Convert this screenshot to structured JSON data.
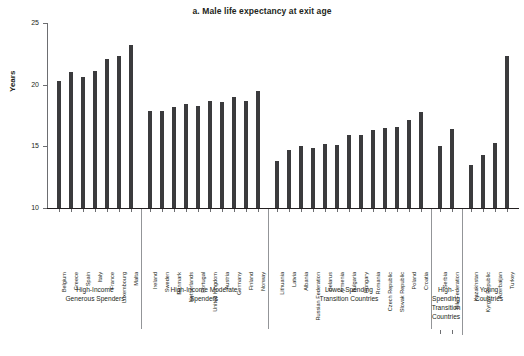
{
  "chart_data": {
    "type": "bar",
    "title": "a. Male life expectancy at exit age",
    "xlabel": "",
    "ylabel": "Years",
    "ylim": [
      10,
      25
    ],
    "yticks": [
      10,
      15,
      20,
      25
    ],
    "grid": false,
    "legend": "none",
    "bar_color": "#3b3b3d",
    "categories": [
      "Belgium",
      "Greece",
      "Spain",
      "Italy",
      "France",
      "Luxembourg",
      "Malta",
      "Ireland",
      "Sweden",
      "Denmark",
      "Netherlands",
      "Portugal",
      "United Kingdom",
      "Austria",
      "Germany",
      "Finland",
      "Norway",
      "Lithuania",
      "Latvia",
      "Albania",
      "Russian Federation",
      "Belarus",
      "Armenia",
      "Bulgaria",
      "Hungary",
      "Romania",
      "Czech Republic",
      "Slovak Republic",
      "Poland",
      "Croatia",
      "Serbia",
      "BiH Federation",
      "Kazakhstan",
      "Kyrgyz Republic",
      "Azerbaijan",
      "Turkey"
    ],
    "values": [
      20.3,
      21.0,
      20.6,
      21.1,
      22.1,
      22.3,
      23.2,
      17.9,
      17.9,
      18.2,
      18.4,
      18.3,
      18.7,
      18.6,
      19.0,
      18.7,
      19.5,
      13.8,
      14.7,
      15.0,
      14.9,
      15.2,
      15.1,
      15.9,
      15.9,
      16.3,
      16.5,
      16.6,
      17.1,
      17.8,
      15.0,
      16.4,
      13.5,
      14.3,
      15.3,
      22.3
    ],
    "groups": [
      {
        "label": "High-Income\nGenerous Spenders",
        "start": 0,
        "end": 6
      },
      {
        "label": "High-Income Moderate\nSpenders",
        "start": 7,
        "end": 16
      },
      {
        "label": "Lower-Spending\nTransition Countries",
        "start": 17,
        "end": 29
      },
      {
        "label": "High-\nSpending\nTransition\nCountries",
        "start": 30,
        "end": 31
      },
      {
        "label": "Young\nCountries",
        "start": 32,
        "end": 35
      }
    ]
  }
}
